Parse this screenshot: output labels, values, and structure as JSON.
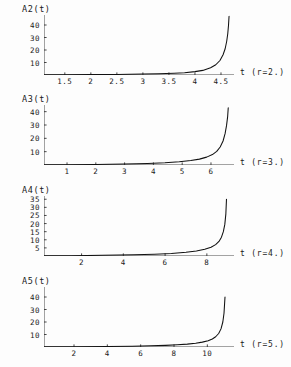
{
  "figure": {
    "background": "#fdfdfd",
    "ink": "#1a1a1a",
    "axis_color": "#333333",
    "curve_color": "#111111"
  },
  "chart_data": [
    {
      "type": "line",
      "title": "A2(t)",
      "ylabel": "A2(t)",
      "xlabel": "t  (r=2.)",
      "parameter_label": "(r=2.)",
      "axis_variable": "t",
      "r": 2,
      "xlim": [
        1.1,
        4.75
      ],
      "ylim": [
        0,
        48
      ],
      "xticks": [
        "1.5",
        "2",
        "2.5",
        "3",
        "3.5",
        "4",
        "4.5"
      ],
      "xtick_values": [
        1.5,
        2,
        2.5,
        3,
        3.5,
        4,
        4.5
      ],
      "yticks": [
        "10",
        "20",
        "30",
        "40"
      ],
      "ytick_values": [
        10,
        20,
        30,
        40
      ],
      "grid": false,
      "legend": "none",
      "blowup_time": 4.66,
      "x": [
        1.1,
        1.5,
        2.0,
        2.5,
        3.0,
        3.3,
        3.6,
        3.8,
        4.0,
        4.15,
        4.3,
        4.4,
        4.48,
        4.54,
        4.58,
        4.61,
        4.63,
        4.645,
        4.655
      ],
      "y": [
        0.18,
        0.23,
        0.33,
        0.48,
        0.75,
        1.0,
        1.4,
        1.85,
        2.7,
        3.7,
        5.8,
        8.2,
        11.6,
        16.2,
        21.0,
        27.0,
        33.0,
        40.0,
        47.0
      ]
    },
    {
      "type": "line",
      "title": "A3(t)",
      "ylabel": "A3(t)",
      "xlabel": "t  (r=3.)",
      "parameter_label": "(r=3.)",
      "axis_variable": "t",
      "r": 3,
      "xlim": [
        0.2,
        6.8
      ],
      "ylim": [
        0,
        45
      ],
      "xticks": [
        "1",
        "2",
        "3",
        "4",
        "5",
        "6"
      ],
      "xtick_values": [
        1,
        2,
        3,
        4,
        5,
        6
      ],
      "yticks": [
        "10",
        "20",
        "30",
        "40"
      ],
      "ytick_values": [
        10,
        20,
        30,
        40
      ],
      "grid": false,
      "legend": "none",
      "blowup_time": 6.6,
      "x": [
        0.2,
        1.0,
        2.0,
        3.0,
        3.8,
        4.4,
        4.9,
        5.3,
        5.6,
        5.85,
        6.05,
        6.2,
        6.32,
        6.42,
        6.49,
        6.54,
        6.58,
        6.6
      ],
      "y": [
        0.15,
        0.25,
        0.45,
        0.8,
        1.2,
        1.7,
        2.4,
        3.3,
        4.4,
        5.9,
        7.8,
        10.2,
        13.5,
        18.0,
        23.5,
        29.5,
        36.5,
        43.0
      ]
    },
    {
      "type": "line",
      "title": "A4(t)",
      "ylabel": "A4(t)",
      "xlabel": "t  (r=4.)",
      "parameter_label": "(r=4.)",
      "axis_variable": "t",
      "r": 4,
      "xlim": [
        0.2,
        9.3
      ],
      "ylim": [
        0,
        37
      ],
      "xticks": [
        "2",
        "4",
        "6",
        "8"
      ],
      "xtick_values": [
        2,
        4,
        6,
        8
      ],
      "yticks": [
        "5",
        "10",
        "15",
        "20",
        "25",
        "30",
        "35"
      ],
      "ytick_values": [
        5,
        10,
        15,
        20,
        25,
        30,
        35
      ],
      "grid": false,
      "legend": "none",
      "blowup_time": 8.95,
      "x": [
        0.2,
        1.5,
        3.0,
        4.5,
        5.5,
        6.3,
        7.0,
        7.5,
        7.9,
        8.2,
        8.42,
        8.58,
        8.7,
        8.79,
        8.86,
        8.91,
        8.94
      ],
      "y": [
        0.1,
        0.2,
        0.4,
        0.75,
        1.1,
        1.6,
        2.3,
        3.1,
        4.1,
        5.4,
        7.0,
        9.0,
        11.6,
        15.0,
        19.5,
        26.0,
        35.0
      ]
    },
    {
      "type": "line",
      "title": "A5(t)",
      "ylabel": "A5(t)",
      "xlabel": "t  (r=5.)",
      "parameter_label": "(r=5.)",
      "axis_variable": "t",
      "r": 5,
      "xlim": [
        0.2,
        11.6
      ],
      "ylim": [
        0,
        48
      ],
      "xticks": [
        "2",
        "4",
        "6",
        "8",
        "10"
      ],
      "xtick_values": [
        2,
        4,
        6,
        8,
        10
      ],
      "yticks": [
        "10",
        "20",
        "30",
        "40"
      ],
      "ytick_values": [
        10,
        20,
        30,
        40
      ],
      "grid": false,
      "legend": "none",
      "blowup_time": 11.1,
      "x": [
        0.2,
        2.0,
        4.0,
        5.5,
        6.6,
        7.5,
        8.2,
        8.8,
        9.3,
        9.7,
        10.05,
        10.3,
        10.5,
        10.68,
        10.82,
        10.93,
        11.0,
        11.06
      ],
      "y": [
        0.1,
        0.2,
        0.4,
        0.65,
        0.95,
        1.3,
        1.75,
        2.3,
        3.0,
        3.9,
        5.0,
        6.4,
        8.2,
        10.8,
        14.5,
        20.0,
        27.0,
        40.0
      ]
    }
  ]
}
